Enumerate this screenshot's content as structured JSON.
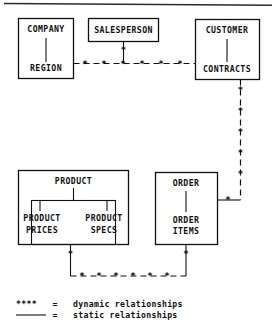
{
  "diagram": {
    "type": "entity-relationship",
    "line_color": "#111111",
    "background": "#ffffff",
    "entities": [
      {
        "id": "company",
        "label": "COMPANY",
        "box": "company-region-box"
      },
      {
        "id": "region",
        "label": "REGION",
        "box": "company-region-box"
      },
      {
        "id": "salesperson",
        "label": "SALESPERSON",
        "box": "salesperson-box"
      },
      {
        "id": "customer",
        "label": "CUSTOMER",
        "box": "customer-contracts-box"
      },
      {
        "id": "contracts",
        "label": "CONTRACTS",
        "box": "customer-contracts-box"
      },
      {
        "id": "product",
        "label": "PRODUCT",
        "box": "product-box"
      },
      {
        "id": "product_prices",
        "label": "PRODUCT\nPRICES",
        "line1": "PRODUCT",
        "line2": "PRICES",
        "box": "product-inner-box"
      },
      {
        "id": "product_specs",
        "label": "PRODUCT\nSPECS",
        "line1": "PRODUCT",
        "line2": "SPECS",
        "box": "product-inner-box"
      },
      {
        "id": "order",
        "label": "ORDER",
        "box": "order-box"
      },
      {
        "id": "order_items",
        "label": "ORDER\nITEMS",
        "line1": "ORDER",
        "line2": "ITEMS",
        "box": "order-box"
      }
    ],
    "labels": {
      "company": "COMPANY",
      "region": "REGION",
      "salesperson": "SALESPERSON",
      "customer": "CUSTOMER",
      "contracts": "CONTRACTS",
      "product": "PRODUCT",
      "product_prices_1": "PRODUCT",
      "product_prices_2": "PRICES",
      "product_specs_1": "PRODUCT",
      "product_specs_2": "SPECS",
      "order": "ORDER",
      "order_items_1": "ORDER",
      "order_items_2": "ITEMS"
    },
    "relationships": [
      {
        "from": "company-region-box",
        "to": "customer-contracts-box",
        "style": "dynamic",
        "marker": "*"
      },
      {
        "from": "salesperson-box",
        "to": "company-customer-link",
        "style": "dynamic",
        "marker": "*"
      },
      {
        "from": "customer-contracts-box",
        "to": "order-box",
        "style": "dynamic",
        "marker": "*"
      },
      {
        "from": "product-box",
        "to": "order-box",
        "style": "dynamic",
        "marker": "*"
      },
      {
        "from": "company",
        "to": "region",
        "style": "static"
      },
      {
        "from": "customer",
        "to": "contracts",
        "style": "static"
      },
      {
        "from": "product",
        "to": "product_prices",
        "style": "static"
      },
      {
        "from": "product",
        "to": "product_specs",
        "style": "static"
      },
      {
        "from": "order",
        "to": "order_items",
        "style": "static"
      }
    ],
    "marker_glyph": "*"
  },
  "legend": {
    "rows": [
      {
        "symbol": "****",
        "equals": "=",
        "text": "dynamic relationships",
        "style": "dynamic"
      },
      {
        "symbol": "----",
        "equals": "=",
        "text": "static relationships",
        "style": "static"
      }
    ],
    "dynamic_symbol": "****",
    "static_symbol": "———",
    "equals": "=",
    "dynamic_text": "dynamic relationships",
    "static_text": "static relationships"
  }
}
